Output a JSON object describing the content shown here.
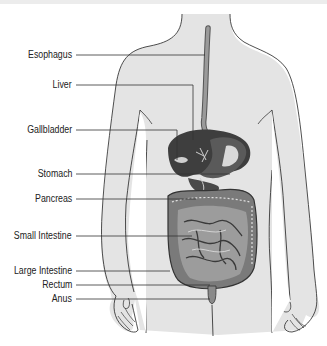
{
  "diagram": {
    "colors": {
      "body_fill": "#e4e4e4",
      "outline": "#222222",
      "organ_dark": "#4a4a4a",
      "organ_mid": "#8a8a8a",
      "esophagus": "#8c8c8c",
      "leader_line": "#333333"
    },
    "labels": [
      {
        "id": "esophagus",
        "text": "Esophagus",
        "y": 55,
        "x_end": 218
      },
      {
        "id": "liver",
        "text": "Liver",
        "y": 85,
        "x_end": 190
      },
      {
        "id": "gallbladder",
        "text": "Gallbladder",
        "y": 130,
        "x_end": 177
      },
      {
        "id": "stomach",
        "text": "Stomach",
        "y": 174,
        "x_end": 230
      },
      {
        "id": "pancreas",
        "text": "Pancreas",
        "y": 199,
        "x_end": 196
      },
      {
        "id": "small-intestine",
        "text": "Small Intestine",
        "y": 236,
        "x_end": 192
      },
      {
        "id": "large-intestine",
        "text": "Large Intestine",
        "y": 271,
        "x_end": 170
      },
      {
        "id": "rectum",
        "text": "Rectum",
        "y": 285,
        "x_end": 210
      },
      {
        "id": "anus",
        "text": "Anus",
        "y": 299,
        "x_end": 210
      }
    ]
  }
}
